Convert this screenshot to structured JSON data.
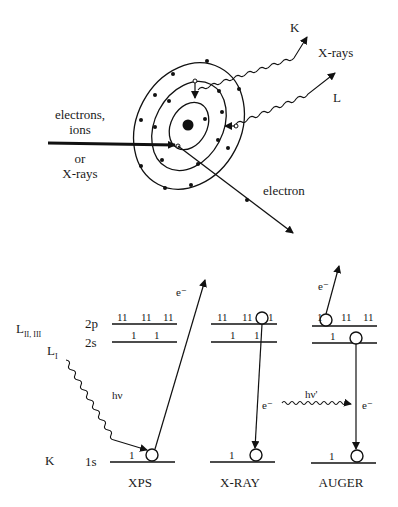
{
  "atom_diagram": {
    "incoming_label_lines": [
      "electrons,",
      "ions",
      "or",
      "X-rays"
    ],
    "xray_label": "X-rays",
    "k_label": "K",
    "l_label": "L",
    "ejected_label": "electron"
  },
  "energy_diagram": {
    "shell_labels": {
      "L23": "L",
      "L23_sub": "II, III",
      "L1": "L",
      "L1_sub": "I",
      "K": "K"
    },
    "orbital_labels": {
      "p2": "2p",
      "s2": "2s",
      "s1": "1s"
    },
    "photon_in": "hν",
    "photon_out": "hν'",
    "electron": "e⁻",
    "panels": [
      {
        "name": "XPS",
        "2p": [
          "11",
          "11",
          "11"
        ],
        "2s": [
          "1",
          "1"
        ],
        "1s": "1"
      },
      {
        "name": "X-RAY",
        "2p": [
          "11",
          "11",
          "1"
        ],
        "2s": [
          "1",
          "1"
        ],
        "1s": "1"
      },
      {
        "name": "AUGER",
        "2p": [
          "1",
          "11",
          "11"
        ],
        "2s": [
          "1"
        ],
        "1s": "1"
      }
    ]
  }
}
